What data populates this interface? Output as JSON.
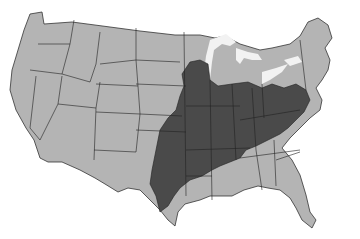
{
  "map": {
    "type": "choropleth",
    "region": "Contiguous United States",
    "colors": {
      "background": "#ffffff",
      "light_region": "#b4b4b4",
      "dark_region": "#4a4a4a",
      "lakes": "#f2f2f2",
      "borders": "#222222"
    },
    "shaded_dark_area": "Central and eastern Midwest / South (Mississippi valley, Ohio valley, Mid-Atlantic)"
  }
}
